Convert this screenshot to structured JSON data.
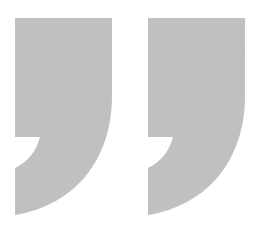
{
  "graphic": {
    "description": "Two large gray closing quotation marks with speckled texture",
    "glyph": "”",
    "marks": [
      {
        "id": "left",
        "offset_x": 0
      },
      {
        "id": "right",
        "offset_x": 133
      }
    ],
    "fill_color": "#c2c2c2",
    "background_color": "#ffffff"
  }
}
